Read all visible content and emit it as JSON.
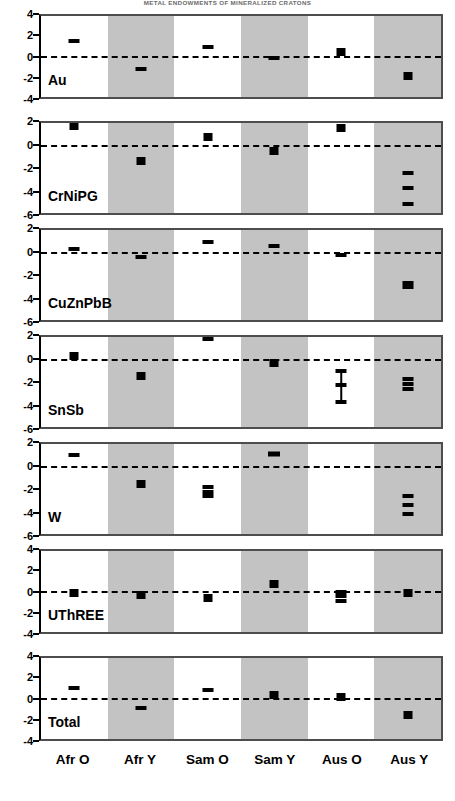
{
  "figure": {
    "title": "METAL ENDOWMENTS OF MINERALIZED CRATONS",
    "categories": [
      "Afr O",
      "Afr Y",
      "Sam O",
      "Sam Y",
      "Aus O",
      "Aus Y"
    ]
  },
  "chart_data": {
    "type": "scatter",
    "title": "METAL ENDOWMENTS OF MINERALIZED CRATONS",
    "xlabel": "",
    "ylabel": "",
    "grid": false,
    "legend": "none",
    "zero_reference_line": 0,
    "categories": [
      "Afr O",
      "Afr Y",
      "Sam O",
      "Sam Y",
      "Aus O",
      "Aus Y"
    ],
    "band_shading": [
      "plain",
      "shaded",
      "plain",
      "shaded",
      "plain",
      "shaded"
    ],
    "panels": [
      {
        "name": "Au",
        "ylim": [
          -4,
          4
        ],
        "yticks": [
          4,
          2,
          0,
          -2,
          -4
        ],
        "points": [
          {
            "category": "Afr O",
            "value": 1.5,
            "style": "dash"
          },
          {
            "category": "Afr Y",
            "value": -1.25,
            "style": "dash"
          },
          {
            "category": "Sam O",
            "value": 0.9,
            "style": "dash"
          },
          {
            "category": "Sam Y",
            "value": -0.1,
            "style": "dash"
          },
          {
            "category": "Aus O",
            "value": 0.45,
            "style": "sq"
          },
          {
            "category": "Aus Y",
            "value": -1.9,
            "style": "sq"
          }
        ]
      },
      {
        "name": "CrNiPG",
        "ylim": [
          -6,
          2
        ],
        "yticks": [
          2,
          0,
          -2,
          -4,
          -6
        ],
        "points": [
          {
            "category": "Afr O",
            "value": 1.75,
            "style": "sq"
          },
          {
            "category": "Afr Y",
            "value": -1.4,
            "style": "sq"
          },
          {
            "category": "Sam O",
            "value": 0.8,
            "style": "sq"
          },
          {
            "category": "Sam Y",
            "value": -0.5,
            "style": "sq"
          },
          {
            "category": "Aus O",
            "value": 1.55,
            "style": "sq"
          },
          {
            "category": "Aus Y",
            "value": -3.8,
            "style": "dash",
            "extra_values": [
              -2.4,
              -5.2
            ]
          }
        ]
      },
      {
        "name": "CuZnPbB",
        "ylim": [
          -6,
          2
        ],
        "yticks": [
          2,
          0,
          -2,
          -4,
          -6
        ],
        "points": [
          {
            "category": "Afr O",
            "value": 0.3,
            "style": "dash"
          },
          {
            "category": "Afr Y",
            "value": -0.4,
            "style": "dash"
          },
          {
            "category": "Sam O",
            "value": 0.9,
            "style": "dash"
          },
          {
            "category": "Sam Y",
            "value": 0.55,
            "style": "dash"
          },
          {
            "category": "Aus O",
            "value": -0.25,
            "style": "dash"
          },
          {
            "category": "Aus Y",
            "value": -2.75,
            "style": "dash",
            "extra_values": [
              -3.1
            ]
          }
        ]
      },
      {
        "name": "SnSb",
        "ylim": [
          -6,
          2
        ],
        "yticks": [
          2,
          0,
          -2,
          -4,
          -6
        ],
        "points": [
          {
            "category": "Afr O",
            "value": 0.35,
            "style": "sq"
          },
          {
            "category": "Afr Y",
            "value": -1.45,
            "style": "sq"
          },
          {
            "category": "Sam O",
            "value": 1.85,
            "style": "dash"
          },
          {
            "category": "Sam Y",
            "value": -0.3,
            "style": "sq"
          },
          {
            "category": "Aus O",
            "value": -2.3,
            "style": "dash",
            "extra_values": [
              -1.05,
              -3.8
            ],
            "error_bar": [
              -1.05,
              -3.8
            ]
          },
          {
            "category": "Aus Y",
            "value": -2.2,
            "style": "dash",
            "extra_values": [
              -1.75,
              -2.6
            ]
          }
        ]
      },
      {
        "name": "W",
        "ylim": [
          -6,
          2
        ],
        "yticks": [
          2,
          0,
          -2,
          -4,
          -6
        ],
        "points": [
          {
            "category": "Afr O",
            "value": 1.0,
            "style": "dash"
          },
          {
            "category": "Afr Y",
            "value": -1.55,
            "style": "sq"
          },
          {
            "category": "Sam O",
            "value": -2.25,
            "style": "dash",
            "extra_values": [
              -1.8,
              -2.65
            ]
          },
          {
            "category": "Sam Y",
            "value": 1.1,
            "style": "wide"
          },
          {
            "category": "Aus O",
            "value": null,
            "style": "none"
          },
          {
            "category": "Aus Y",
            "value": -3.4,
            "style": "dash",
            "extra_values": [
              -2.6,
              -4.25
            ]
          }
        ]
      },
      {
        "name": "UThREE",
        "ylim": [
          -4,
          4
        ],
        "yticks": [
          4,
          2,
          0,
          -2,
          -4
        ],
        "points": [
          {
            "category": "Afr O",
            "value": -0.1,
            "style": "sq"
          },
          {
            "category": "Afr Y",
            "value": -0.3,
            "style": "sq"
          },
          {
            "category": "Sam O",
            "value": -0.65,
            "style": "sq"
          },
          {
            "category": "Sam Y",
            "value": 0.7,
            "style": "sq"
          },
          {
            "category": "Aus O",
            "value": -0.45,
            "style": "dash",
            "extra_values": [
              -0.05,
              -0.9
            ]
          },
          {
            "category": "Aus Y",
            "value": -0.15,
            "style": "sq"
          }
        ]
      },
      {
        "name": "Total",
        "ylim": [
          -4,
          4
        ],
        "yticks": [
          4,
          2,
          0,
          -2,
          -4
        ],
        "points": [
          {
            "category": "Afr O",
            "value": 1.05,
            "style": "dash"
          },
          {
            "category": "Afr Y",
            "value": -0.9,
            "style": "dash"
          },
          {
            "category": "Sam O",
            "value": 0.85,
            "style": "dash"
          },
          {
            "category": "Sam Y",
            "value": 0.35,
            "style": "sq"
          },
          {
            "category": "Aus O",
            "value": 0.1,
            "style": "sq"
          },
          {
            "category": "Aus Y",
            "value": -1.6,
            "style": "sq"
          }
        ]
      }
    ]
  },
  "colors": {
    "shaded_band": "#c3c3c3",
    "plain_band": "#ffffff",
    "marker": "#000000",
    "frame": "#4d4d4d",
    "title": "#6a6a6a"
  }
}
